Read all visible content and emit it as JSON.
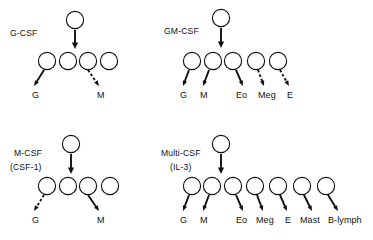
{
  "figure": {
    "name": "colony-stimulating-factor-lineage-diagram",
    "background_color": "#ffffff",
    "ink_color": "#111111",
    "width": 373,
    "height": 240
  },
  "panels": [
    {
      "id": "g-csf",
      "title": "G-CSF",
      "subtitle": "",
      "title_x": 10,
      "title_y": 36,
      "subtitle_x": 0,
      "subtitle_y": 0,
      "stem_cell": {
        "cx": 75,
        "cy": 20,
        "r": 8.6
      },
      "stem_arrow": {
        "x1": 75,
        "y1": 30,
        "x2": 75,
        "y2": 49,
        "style": "solid"
      },
      "progenitors": [
        {
          "cx": 47,
          "cy": 61,
          "r": 8.6
        },
        {
          "cx": 68,
          "cy": 61,
          "r": 8.6
        },
        {
          "cx": 88,
          "cy": 61,
          "r": 8.6
        },
        {
          "cx": 109,
          "cy": 61,
          "r": 8.6
        }
      ],
      "outputs": [
        {
          "label": "G",
          "from_index": 0,
          "x1": 44,
          "y1": 70,
          "x2": 34,
          "y2": 86,
          "style": "solid",
          "label_x": 32,
          "label_y": 98
        },
        {
          "label": "M",
          "from_index": 2,
          "x1": 88,
          "y1": 70,
          "x2": 99,
          "y2": 86,
          "style": "dashed",
          "label_x": 97,
          "label_y": 98
        }
      ]
    },
    {
      "id": "gm-csf",
      "title": "GM-CSF",
      "subtitle": "",
      "title_x": 164,
      "title_y": 34,
      "subtitle_x": 0,
      "subtitle_y": 0,
      "stem_cell": {
        "cx": 221,
        "cy": 18,
        "r": 8.6
      },
      "stem_arrow": {
        "x1": 221,
        "y1": 28,
        "x2": 221,
        "y2": 48,
        "style": "solid"
      },
      "progenitors": [
        {
          "cx": 192,
          "cy": 61,
          "r": 8.6
        },
        {
          "cx": 213,
          "cy": 61,
          "r": 8.6
        },
        {
          "cx": 233,
          "cy": 61,
          "r": 8.6
        },
        {
          "cx": 256,
          "cy": 61,
          "r": 8.6
        },
        {
          "cx": 278,
          "cy": 61,
          "r": 8.6
        }
      ],
      "outputs": [
        {
          "label": "G",
          "from_index": 0,
          "x1": 189,
          "y1": 70,
          "x2": 183,
          "y2": 86,
          "style": "solid",
          "label_x": 180,
          "label_y": 98
        },
        {
          "label": "M",
          "from_index": 1,
          "x1": 209,
          "y1": 70,
          "x2": 203,
          "y2": 86,
          "style": "solid",
          "label_x": 200,
          "label_y": 98
        },
        {
          "label": "Eo",
          "from_index": 2,
          "x1": 236,
          "y1": 70,
          "x2": 243,
          "y2": 86,
          "style": "solid",
          "label_x": 236,
          "label_y": 98
        },
        {
          "label": "Meg",
          "from_index": 3,
          "x1": 258,
          "y1": 70,
          "x2": 264,
          "y2": 86,
          "style": "dashed",
          "label_x": 258,
          "label_y": 98
        },
        {
          "label": "E",
          "from_index": 4,
          "x1": 280,
          "y1": 70,
          "x2": 289,
          "y2": 86,
          "style": "dashed",
          "label_x": 287,
          "label_y": 98
        }
      ]
    },
    {
      "id": "m-csf",
      "title": "M-CSF",
      "subtitle": "(CSF-1)",
      "title_x": 14,
      "title_y": 156,
      "subtitle_x": 10,
      "subtitle_y": 170,
      "stem_cell": {
        "cx": 71,
        "cy": 144,
        "r": 8.6
      },
      "stem_arrow": {
        "x1": 71,
        "y1": 154,
        "x2": 71,
        "y2": 174,
        "style": "solid"
      },
      "progenitors": [
        {
          "cx": 47,
          "cy": 186,
          "r": 8.6
        },
        {
          "cx": 68,
          "cy": 186,
          "r": 8.6
        },
        {
          "cx": 88,
          "cy": 186,
          "r": 8.6
        },
        {
          "cx": 110,
          "cy": 186,
          "r": 8.6
        }
      ],
      "outputs": [
        {
          "label": "G",
          "from_index": 0,
          "x1": 44,
          "y1": 195,
          "x2": 34,
          "y2": 211,
          "style": "dashed",
          "label_x": 32,
          "label_y": 223
        },
        {
          "label": "M",
          "from_index": 2,
          "x1": 88,
          "y1": 195,
          "x2": 99,
          "y2": 211,
          "style": "solid",
          "label_x": 97,
          "label_y": 223
        }
      ]
    },
    {
      "id": "multi-csf",
      "title": "Multi-CSF",
      "subtitle": "(IL-3)",
      "title_x": 161,
      "title_y": 156,
      "subtitle_x": 170,
      "subtitle_y": 170,
      "stem_cell": {
        "cx": 221,
        "cy": 144,
        "r": 8.6
      },
      "stem_arrow": {
        "x1": 221,
        "y1": 154,
        "x2": 221,
        "y2": 174,
        "style": "solid"
      },
      "progenitors": [
        {
          "cx": 192,
          "cy": 186,
          "r": 8.6
        },
        {
          "cx": 212,
          "cy": 186,
          "r": 8.6
        },
        {
          "cx": 233,
          "cy": 186,
          "r": 8.6
        },
        {
          "cx": 255,
          "cy": 186,
          "r": 8.6
        },
        {
          "cx": 278,
          "cy": 186,
          "r": 8.6
        },
        {
          "cx": 302,
          "cy": 186,
          "r": 8.6
        },
        {
          "cx": 326,
          "cy": 186,
          "r": 8.6
        }
      ],
      "outputs": [
        {
          "label": "G",
          "from_index": 0,
          "x1": 189,
          "y1": 195,
          "x2": 183,
          "y2": 211,
          "style": "solid",
          "label_x": 180,
          "label_y": 223
        },
        {
          "label": "M",
          "from_index": 1,
          "x1": 209,
          "y1": 195,
          "x2": 203,
          "y2": 211,
          "style": "solid",
          "label_x": 200,
          "label_y": 223
        },
        {
          "label": "Eo",
          "from_index": 2,
          "x1": 236,
          "y1": 195,
          "x2": 243,
          "y2": 211,
          "style": "solid",
          "label_x": 236,
          "label_y": 223
        },
        {
          "label": "Meg",
          "from_index": 3,
          "x1": 257,
          "y1": 195,
          "x2": 263,
          "y2": 211,
          "style": "solid",
          "label_x": 256,
          "label_y": 223
        },
        {
          "label": "E",
          "from_index": 4,
          "x1": 280,
          "y1": 195,
          "x2": 287,
          "y2": 211,
          "style": "solid",
          "label_x": 285,
          "label_y": 223
        },
        {
          "label": "Mast",
          "from_index": 5,
          "x1": 304,
          "y1": 195,
          "x2": 312,
          "y2": 211,
          "style": "solid",
          "label_x": 300,
          "label_y": 223
        },
        {
          "label": "B-lymph",
          "from_index": 6,
          "x1": 328,
          "y1": 195,
          "x2": 338,
          "y2": 211,
          "style": "solid",
          "label_x": 328,
          "label_y": 223
        }
      ]
    }
  ]
}
